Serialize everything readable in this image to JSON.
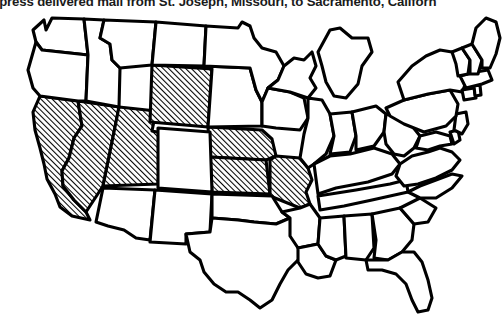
{
  "figure": {
    "caption": "Express delivered mail from St. Joseph, Missouri, to Sacramento, California",
    "caption_visible_fragment": "xpress delivered mail from St. Joseph, Missouri, to Sacramento, Californ",
    "background_color": "#ffffff",
    "outline_color": "#000000",
    "hatch_color": "#000000",
    "hatch_angle_degrees": 45,
    "hatch_spacing_px": 2
  },
  "map": {
    "title": "United States",
    "projection_note": "contiguous-48-states",
    "legend": {
      "hatched_meaning": "Pony Express route states",
      "plain_meaning": "Other states"
    },
    "highlighted_states": [
      "California",
      "Nevada",
      "Utah",
      "Wyoming",
      "Nebraska",
      "Kansas",
      "Missouri"
    ],
    "plain_states": [
      "Washington",
      "Oregon",
      "Idaho",
      "Montana",
      "North Dakota",
      "South Dakota",
      "Minnesota",
      "Wisconsin",
      "Michigan",
      "Iowa",
      "Illinois",
      "Indiana",
      "Ohio",
      "Colorado",
      "Arizona",
      "New Mexico",
      "Texas",
      "Oklahoma",
      "Arkansas",
      "Louisiana",
      "Mississippi",
      "Alabama",
      "Tennessee",
      "Kentucky",
      "Georgia",
      "Florida",
      "South Carolina",
      "North Carolina",
      "Virginia",
      "West Virginia",
      "Maryland",
      "Delaware",
      "New Jersey",
      "Pennsylvania",
      "New York",
      "Connecticut",
      "Rhode Island",
      "Massachusetts",
      "Vermont",
      "New Hampshire",
      "Maine"
    ]
  }
}
